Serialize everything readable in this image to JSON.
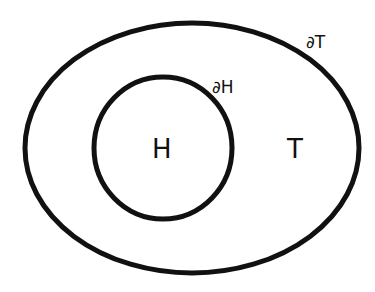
{
  "diagram": {
    "type": "nested-regions",
    "stroke_color": "#111111",
    "background": "#ffffff",
    "outer_region": {
      "label": "T",
      "boundary_label": "∂T",
      "shape": "ellipse",
      "cx": 192,
      "cy": 148,
      "rx": 167,
      "ry": 125
    },
    "inner_region": {
      "label": "H",
      "boundary_label": "∂H",
      "shape": "circle",
      "cx": 163,
      "cy": 148,
      "rx": 69,
      "ry": 71
    }
  }
}
